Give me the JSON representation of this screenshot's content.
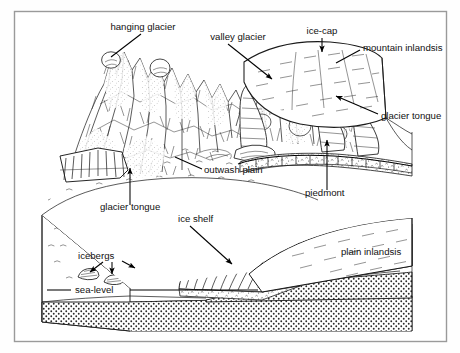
{
  "figure": {
    "frame": {
      "border_color": "#9a9a9a",
      "background": "#ffffff"
    },
    "ink_color": "#1a1a1a",
    "canvas": {
      "width": 460,
      "height": 353
    }
  },
  "labels": [
    {
      "id": "hanging-glacier",
      "text": "hanging glacier",
      "x": 143,
      "y": 30,
      "anchor": "middle"
    },
    {
      "id": "valley-glacier",
      "text": "valley glacier",
      "x": 238,
      "y": 40,
      "anchor": "middle"
    },
    {
      "id": "ice-cap",
      "text": "ice-cap",
      "x": 322,
      "y": 34,
      "anchor": "middle"
    },
    {
      "id": "mountain-inlandsis",
      "text": "mountain inlandsis",
      "x": 363,
      "y": 51,
      "anchor": "start"
    },
    {
      "id": "glacier-tongue-right",
      "text": "glacier tongue",
      "x": 381,
      "y": 119,
      "anchor": "start"
    },
    {
      "id": "outwash-plain",
      "text": "outwash plain",
      "x": 204,
      "y": 173,
      "anchor": "start"
    },
    {
      "id": "piedmont",
      "text": "piedmont",
      "x": 305,
      "y": 196,
      "anchor": "start"
    },
    {
      "id": "glacier-tongue-left",
      "text": "glacier tongue",
      "x": 100,
      "y": 210,
      "anchor": "start"
    },
    {
      "id": "ice-shelf",
      "text": "ice shelf",
      "x": 178,
      "y": 222,
      "anchor": "start"
    },
    {
      "id": "icebergs",
      "text": "icebergs",
      "x": 78,
      "y": 259,
      "anchor": "start"
    },
    {
      "id": "plain-inlandsis",
      "text": "plain inlandsis",
      "x": 341,
      "y": 255,
      "anchor": "start"
    },
    {
      "id": "sea-level",
      "text": "sea-level",
      "x": 75,
      "y": 293,
      "anchor": "start"
    }
  ],
  "leaders": [
    {
      "id": "leader-hanging-glacier",
      "path": "M 141 34 L 111 57",
      "arrow": false
    },
    {
      "id": "leader-valley-glacier",
      "path": "M 228 44 L 272 79",
      "arrow": true
    },
    {
      "id": "leader-ice-cap",
      "path": "M 322 38 L 322 52",
      "arrow": true
    },
    {
      "id": "leader-mountain-inlandsis",
      "path": "M 360 50 L 336 63",
      "arrow": false
    },
    {
      "id": "leader-glacier-tongue-right",
      "path": "M 378 114 L 336 96",
      "arrow": true
    },
    {
      "id": "leader-outwash-plain",
      "path": "M 202 169 L 175 157",
      "arrow": false
    },
    {
      "id": "leader-piedmont",
      "path": "M 327 190 L 327 140",
      "arrow": true
    },
    {
      "id": "leader-glacier-tongue-left",
      "path": "M 130 205 L 130 168",
      "arrow": true
    },
    {
      "id": "leader-ice-shelf",
      "path": "M 190 226 L 232 264",
      "arrow": true
    },
    {
      "id": "leader-iceberg-a",
      "path": "M 103 262 L 90 272",
      "arrow": true
    },
    {
      "id": "leader-iceberg-b",
      "path": "M 112 262 L 112 274",
      "arrow": true
    },
    {
      "id": "leader-iceberg-c",
      "path": "M 122 261 L 135 268",
      "arrow": true
    },
    {
      "id": "leader-sea-level",
      "path": "M 71 290 L 47 290",
      "arrow": false
    }
  ],
  "sea_level_rule": {
    "id": "sea-level-rule",
    "x1": 130,
    "x2": 258,
    "y": 290
  },
  "features": {
    "mountain_range": "hachured peaks with stipple, left and centre foreground",
    "ice_cap_dome": "smooth ice dome upper right with flow lines",
    "outwash_plain": "stippled plain below glacier snouts",
    "ice_shelf": "floating shelf with hatched cliff face",
    "icebergs": "three small icebergs on the sea surface",
    "bedrock": "dotted bedrock band forming the block base",
    "sea_surface": "scattered short wave ticks"
  }
}
